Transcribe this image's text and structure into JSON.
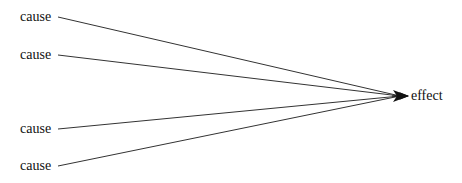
{
  "diagram": {
    "type": "converging-arrows",
    "causes": [
      {
        "label": "cause",
        "y": 17
      },
      {
        "label": "cause",
        "y": 55
      },
      {
        "label": "cause",
        "y": 129
      },
      {
        "label": "cause",
        "y": 166
      }
    ],
    "effect": {
      "label": "effect",
      "x": 410,
      "y": 96
    },
    "line_color": "#333333",
    "text_color": "#111111"
  }
}
